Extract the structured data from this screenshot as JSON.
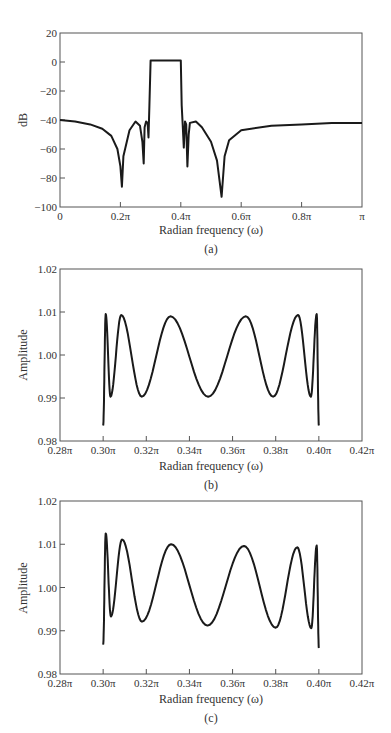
{
  "chart_data": [
    {
      "id": "a",
      "type": "line",
      "caption": "(a)",
      "title": "",
      "xlabel": "Radian frequency (ω)",
      "ylabel": "dB",
      "xlim": [
        0,
        1
      ],
      "ylim": [
        -100,
        20
      ],
      "xticks": [
        0,
        0.2,
        0.4,
        0.6,
        0.8,
        1.0
      ],
      "xtick_labels": [
        "0",
        "0.2π",
        "0.4π",
        "0.6π",
        "0.8π",
        "π"
      ],
      "yticks": [
        20,
        0,
        -20,
        -40,
        -60,
        -80,
        -100
      ],
      "ytick_labels": [
        "20",
        "0",
        "−20",
        "−40",
        "−60",
        "−80",
        "−100"
      ],
      "grid": false,
      "x_unit": "π rad",
      "series": [
        {
          "name": "Magnitude response",
          "x": [
            0,
            0.05,
            0.1,
            0.14,
            0.17,
            0.19,
            0.2,
            0.205,
            0.21,
            0.23,
            0.25,
            0.265,
            0.273,
            0.277,
            0.28,
            0.285,
            0.29,
            0.293,
            0.296,
            0.3,
            0.35,
            0.4,
            0.403,
            0.406,
            0.41,
            0.414,
            0.418,
            0.422,
            0.426,
            0.43,
            0.45,
            0.47,
            0.5,
            0.52,
            0.535,
            0.545,
            0.56,
            0.6,
            0.7,
            0.8,
            0.9,
            1.0
          ],
          "y": [
            -40,
            -41,
            -43,
            -46,
            -51,
            -60,
            -72,
            -86,
            -65,
            -47,
            -41,
            -44,
            -55,
            -70,
            -45,
            -41,
            -42,
            -52,
            -30,
            1,
            1,
            1,
            -30,
            -42,
            -59,
            -41,
            -43,
            -72,
            -50,
            -42,
            -41,
            -45,
            -55,
            -68,
            -93,
            -65,
            -54,
            -47,
            -44,
            -43,
            -42,
            -42
          ]
        }
      ]
    },
    {
      "id": "b",
      "type": "line",
      "caption": "(b)",
      "title": "",
      "xlabel": "Radian frequency (ω)",
      "ylabel": "Amplitude",
      "xlim": [
        0.28,
        0.42
      ],
      "ylim": [
        0.98,
        1.02
      ],
      "xticks": [
        0.28,
        0.3,
        0.32,
        0.34,
        0.36,
        0.38,
        0.4,
        0.42
      ],
      "xtick_labels": [
        "0.28π",
        "0.30π",
        "0.32π",
        "0.34π",
        "0.36π",
        "0.38π",
        "0.40π",
        "0.42π"
      ],
      "yticks": [
        1.02,
        1.01,
        1.0,
        0.99,
        0.98
      ],
      "ytick_labels": [
        "1.02",
        "1.01",
        "1.00",
        "0.99",
        "0.98"
      ],
      "grid": false,
      "series": [
        {
          "name": "Passband amplitude",
          "extrema_x": [
            0.3,
            0.3012,
            0.3034,
            0.3084,
            0.3179,
            0.3312,
            0.3487,
            0.3662,
            0.3788,
            0.3904,
            0.3963,
            0.399,
            0.4
          ],
          "extrema_y": [
            0.9836,
            1.0095,
            0.9903,
            1.0093,
            0.9903,
            1.009,
            0.9903,
            1.009,
            0.9903,
            1.0093,
            0.9903,
            1.0095,
            0.9836
          ]
        }
      ]
    },
    {
      "id": "c",
      "type": "line",
      "caption": "(c)",
      "title": "",
      "xlabel": "Radian frequency (ω)",
      "ylabel": "Amplitude",
      "xlim": [
        0.28,
        0.42
      ],
      "ylim": [
        0.98,
        1.02
      ],
      "xticks": [
        0.28,
        0.3,
        0.32,
        0.34,
        0.36,
        0.38,
        0.4,
        0.42
      ],
      "xtick_labels": [
        "0.28π",
        "0.30π",
        "0.32π",
        "0.34π",
        "0.36π",
        "0.38π",
        "0.40π",
        "0.42π"
      ],
      "yticks": [
        1.02,
        1.01,
        1.0,
        0.99,
        0.98
      ],
      "ytick_labels": [
        "1.02",
        "1.01",
        "1.00",
        "0.99",
        "0.98"
      ],
      "grid": false,
      "series": [
        {
          "name": "Passband amplitude (quantized)",
          "extrema_x": [
            0.3,
            0.3012,
            0.3036,
            0.3088,
            0.318,
            0.3315,
            0.3484,
            0.3653,
            0.38,
            0.39,
            0.3965,
            0.399,
            0.4
          ],
          "extrema_y": [
            0.9868,
            1.0125,
            0.9933,
            1.0111,
            0.9921,
            1.01,
            0.9912,
            1.0096,
            0.9907,
            1.0093,
            0.9906,
            1.0097,
            0.986
          ]
        }
      ]
    }
  ]
}
